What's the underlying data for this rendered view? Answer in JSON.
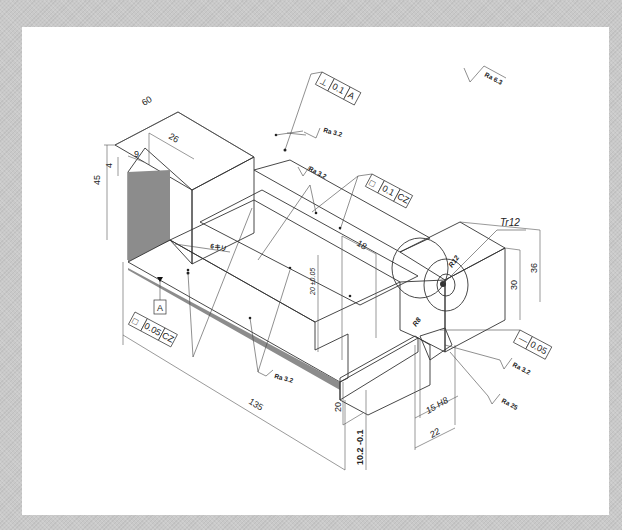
{
  "drawing": {
    "type": "isometric mechanical part drawing",
    "colors": {
      "background": "#c9c9c9",
      "sheet": "#ffffff",
      "face_top": "#ffffff",
      "face_front_light": "#cfcfcf",
      "face_dark": "#8c8c8c",
      "line": "#333333"
    },
    "general_roughness": {
      "symbol": "roughness-check-icon",
      "label": "Ra 6.3"
    },
    "dimensions": {
      "width_top": "60",
      "depth_upright": "26",
      "step_width": "9",
      "step_height": "4",
      "height_overall": "45",
      "slot_width": "18",
      "slot_depth": "20 ±0.05",
      "height_boss_36": "36",
      "height_boss_30": "30",
      "length_overall": "135",
      "base_height": "20",
      "base_offset": "10.2 -0.1",
      "slot_15": "15 H8",
      "slot_22": "22",
      "radius_r12": "R12",
      "radius_r8": "R8",
      "thread": "Tr12",
      "chamfer_note": "6キリ"
    },
    "gdt_frames": [
      {
        "symbol": "⊥",
        "tolerance": "0.1",
        "datum": "A"
      },
      {
        "symbol": "□",
        "tolerance": "0.1",
        "datum": "CZ"
      },
      {
        "symbol": "□",
        "tolerance": "0.05",
        "datum": "CZ"
      },
      {
        "symbol": "—",
        "tolerance": "0.05",
        "datum": ""
      }
    ],
    "datum_label": "A",
    "roughness_callouts": [
      "Ra 3.2",
      "Ra 3.2",
      "Ra 3.2",
      "Ra 3.2",
      "Ra 25"
    ]
  }
}
